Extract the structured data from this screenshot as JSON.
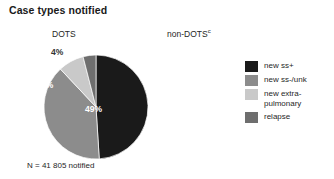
{
  "title": "Case types notified",
  "columns": {
    "left_label": "DOTS",
    "right_label": "non-DOTS",
    "right_superscript": "c"
  },
  "pie_caption": "N = 41 805 notified",
  "legend": {
    "items": [
      {
        "label": "new ss+",
        "color": "#1a1a1a"
      },
      {
        "label": "new ss-/unk",
        "color": "#8c8c8c"
      },
      {
        "label": "new extra-\npulmonary",
        "color": "#c9c9c9"
      },
      {
        "label": "relapse",
        "color": "#6e6e6e"
      }
    ]
  },
  "chart_data": {
    "type": "pie",
    "title": "Case types notified",
    "subtitle": "DOTS",
    "total_label": "N = 41 805 notified",
    "total": 41805,
    "unit": "percent",
    "categories": [
      "new ss+",
      "new ss-/unk",
      "new extra-pulmonary",
      "relapse"
    ],
    "values": [
      49,
      39,
      8,
      4
    ],
    "data_labels": [
      "49%",
      "39%",
      "8%",
      "4%"
    ],
    "colors": [
      "#1a1a1a",
      "#8c8c8c",
      "#c9c9c9",
      "#6e6e6e"
    ],
    "start_angle": 0,
    "direction": "clockwise",
    "legend_position": "right",
    "grid": false
  }
}
